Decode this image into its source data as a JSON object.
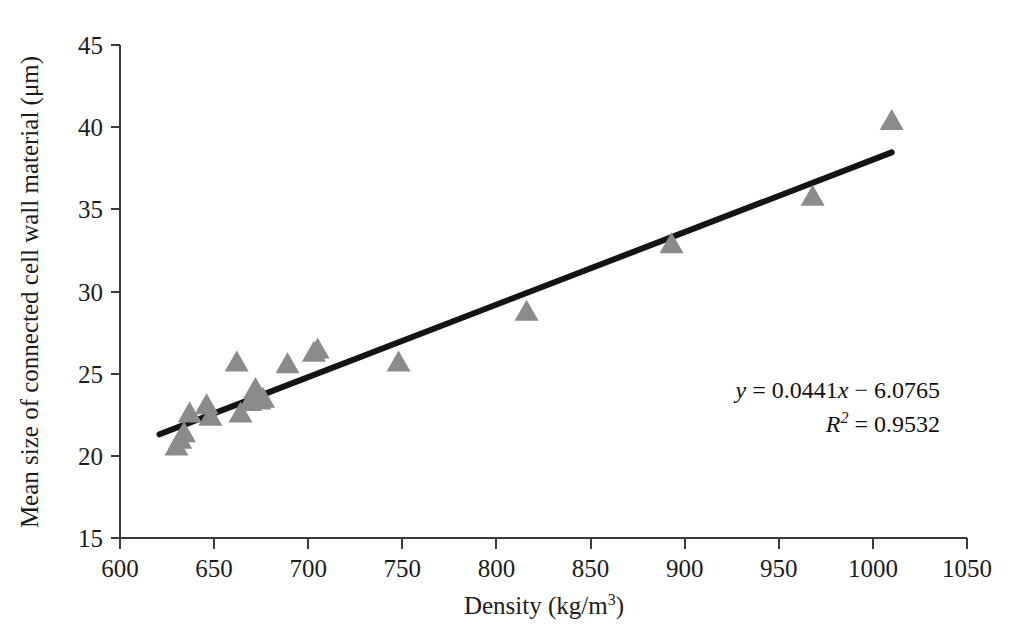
{
  "chart_data": {
    "type": "scatter",
    "title": "",
    "subtitle": "",
    "xlabel": "Density (kg/m3)",
    "xlabel_base": "Density (kg/m",
    "xlabel_exponent": "3",
    "xlabel_close": ")",
    "ylabel": "Mean size of connected cell wall material (μm)",
    "xlim": [
      600,
      1050
    ],
    "ylim": [
      15,
      45
    ],
    "xticks": [
      600,
      650,
      700,
      750,
      800,
      850,
      900,
      950,
      1000,
      1050
    ],
    "yticks": [
      15,
      20,
      25,
      30,
      35,
      40,
      45
    ],
    "grid": false,
    "legend": false,
    "marker_shape": "triangle",
    "marker_color": "#8b8b8b",
    "line_color": "#141414",
    "axis_color": "#3a3a3a",
    "points": [
      {
        "x": 630,
        "y": 20.6
      },
      {
        "x": 632,
        "y": 21.0
      },
      {
        "x": 634,
        "y": 21.4
      },
      {
        "x": 637,
        "y": 22.6
      },
      {
        "x": 646,
        "y": 23.1
      },
      {
        "x": 648,
        "y": 22.4
      },
      {
        "x": 662,
        "y": 25.7
      },
      {
        "x": 664,
        "y": 22.6
      },
      {
        "x": 669,
        "y": 23.3
      },
      {
        "x": 672,
        "y": 24.1
      },
      {
        "x": 674,
        "y": 23.4
      },
      {
        "x": 676,
        "y": 23.5
      },
      {
        "x": 689,
        "y": 25.6
      },
      {
        "x": 703,
        "y": 26.3
      },
      {
        "x": 705,
        "y": 26.5
      },
      {
        "x": 748,
        "y": 25.7
      },
      {
        "x": 816,
        "y": 28.8
      },
      {
        "x": 893,
        "y": 32.9
      },
      {
        "x": 968,
        "y": 35.8
      },
      {
        "x": 1010,
        "y": 40.4
      }
    ],
    "trendline": {
      "slope": 0.0441,
      "intercept": -6.0765,
      "x_start": 621,
      "x_end": 1010,
      "r_squared": 0.9532
    },
    "annotations": {
      "equation_y": "y",
      "equation_eq1": " = 0.0441",
      "equation_x": "x",
      "equation_rest": " − 6.0765",
      "r_symbol": "R",
      "r_exponent": "2",
      "r_value": " = 0.9532"
    }
  }
}
